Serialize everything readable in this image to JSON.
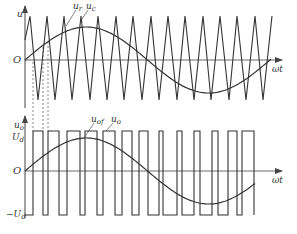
{
  "figure": {
    "colors": {
      "line": "#333333",
      "axis": "#444444",
      "dashed": "#555555",
      "background": "#ffffff"
    }
  },
  "top_plot": {
    "y_axis_label": "u",
    "origin_label": "O",
    "x_axis_label": "ωt",
    "curve_labels": [
      {
        "text": "u",
        "sub": "r"
      },
      {
        "text": "u",
        "sub": "c"
      }
    ],
    "carrier": {
      "type": "triangle",
      "peak_x": [
        30,
        47,
        64,
        81,
        98,
        116,
        133,
        151,
        168,
        185,
        203,
        220,
        237,
        255,
        272
      ],
      "valley_x": [
        38,
        55,
        72,
        90,
        107,
        124,
        142,
        159,
        177,
        194,
        211,
        229,
        246,
        263
      ]
    }
  },
  "bottom_plot": {
    "y_axis_label": "u",
    "y_axis_sub": "o",
    "origin_label": "O",
    "x_axis_label": "ωt",
    "pos_level_label": "U",
    "pos_level_sub": "d",
    "neg_level_label": "−U",
    "neg_level_sub": "d",
    "curve_labels": [
      {
        "text": "u",
        "sub": "of"
      },
      {
        "text": "u",
        "sub": "o"
      }
    ],
    "pulses_high": [
      [
        33,
        43
      ],
      [
        48,
        59
      ],
      [
        67,
        80
      ],
      [
        85,
        97
      ],
      [
        103,
        115
      ],
      [
        122,
        132
      ],
      [
        139,
        148
      ],
      [
        159,
        163
      ],
      [
        177,
        182
      ],
      [
        194,
        200
      ],
      [
        212,
        218
      ],
      [
        228,
        237
      ],
      [
        242,
        254
      ]
    ]
  }
}
